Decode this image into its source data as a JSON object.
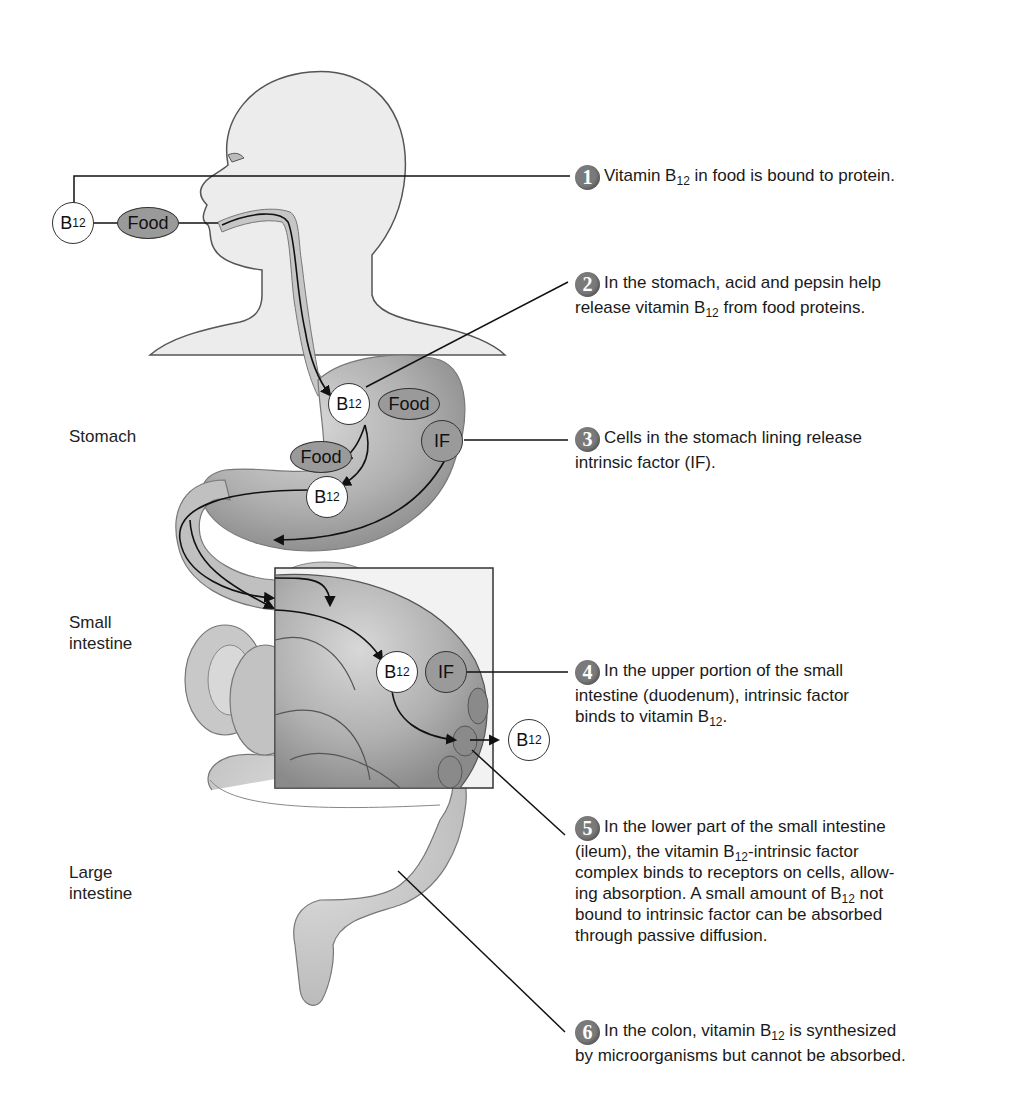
{
  "figure": {
    "colors": {
      "background": "#ffffff",
      "body_fill": "#ececec",
      "organ_fill": "#b5b5b5",
      "organ_dark": "#8c8c8c",
      "b12_fill": "#ffffff",
      "if_fill": "#9a9a9a",
      "food_fill": "#9a9a9a",
      "step_badge": "#7a7a7a",
      "line": "#222222"
    }
  },
  "organ_labels": {
    "stomach": "Stomach",
    "small_intestine_line1": "Small",
    "small_intestine_line2": "intestine",
    "large_intestine_line1": "Large",
    "large_intestine_line2": "intestine"
  },
  "nodes": {
    "b12_base": "B",
    "b12_sub": "12",
    "food": "Food",
    "if": "IF"
  },
  "steps": [
    {
      "number": "1",
      "segments": [
        "Vitamin B",
        "12",
        " in food is bound to protein."
      ]
    },
    {
      "number": "2",
      "line1": "In the stomach, acid and pepsin help",
      "segments2": [
        "release vitamin B",
        "12",
        " from food proteins."
      ]
    },
    {
      "number": "3",
      "line1": "Cells in the stomach lining release",
      "line2": "intrinsic factor (IF)."
    },
    {
      "number": "4",
      "line1": "In the upper portion of the small",
      "line2": "intestine (duodenum), intrinsic factor",
      "segments3": [
        "binds to vitamin B",
        "12",
        "."
      ]
    },
    {
      "number": "5",
      "line1": "In the lower part of the small intestine",
      "segments2": [
        "(ileum), the vitamin B",
        "12",
        "-intrinsic factor"
      ],
      "line3": "complex binds to receptors on cells, allow-",
      "segments4": [
        "ing absorption. A small amount of B",
        "12",
        " not"
      ],
      "line5": "bound to intrinsic factor can be absorbed",
      "line6": "through  passive diffusion."
    },
    {
      "number": "6",
      "segments1": [
        "In the colon, vitamin B",
        "12",
        " is synthesized"
      ],
      "line2": "by microorganisms but  cannot be absorbed."
    }
  ]
}
